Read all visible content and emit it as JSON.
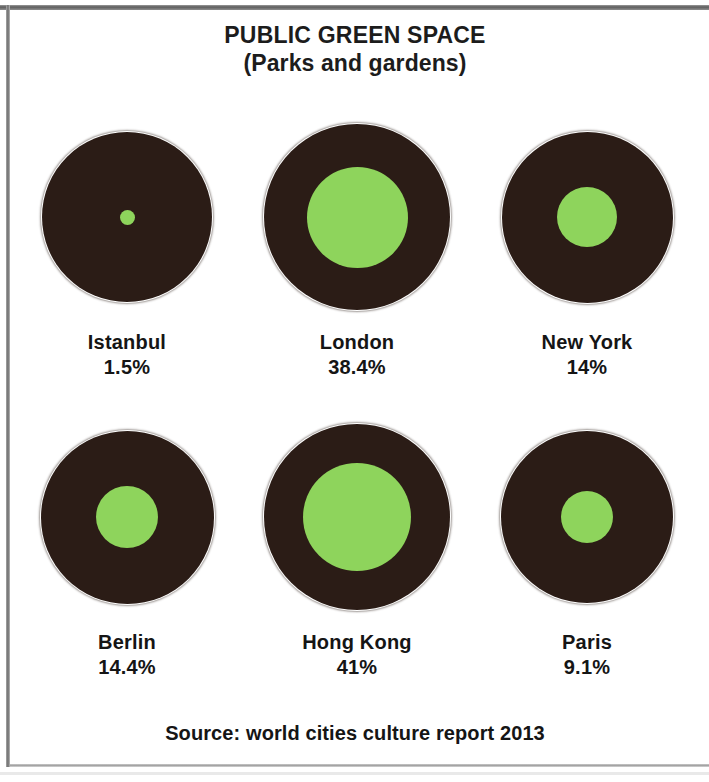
{
  "chart_data": {
    "type": "pie",
    "title": "PUBLIC GREEN SPACE",
    "subtitle": "(Parks and gardens)",
    "xlabel": "",
    "ylabel": "",
    "unit": "%",
    "note": "Each dark disc represents the whole city area; the green disc is the share of public green space (parks and gardens). Green disc area is proportional to the percentage.",
    "source": "Source: world cities culture report 2013",
    "colors": {
      "green": "#8ED45C",
      "dark": "#2B1C16",
      "text": "#151515",
      "background": "#FFFFFF"
    },
    "legend": {
      "position": "none",
      "entries": []
    },
    "grid": false,
    "categories": [
      "Istanbul",
      "London",
      "New York",
      "Berlin",
      "Hong Kong",
      "Paris"
    ],
    "values": [
      1.5,
      38.4,
      14,
      14.4,
      41,
      9.1
    ],
    "cities": [
      {
        "name": "Istanbul",
        "value_label": "1.5%",
        "value": 1.5,
        "outer_diameter_px": 170,
        "inner_diameter_px": 15
      },
      {
        "name": "London",
        "value_label": "38.4%",
        "value": 38.4,
        "outer_diameter_px": 186,
        "inner_diameter_px": 101
      },
      {
        "name": "New York",
        "value_label": "14%",
        "value": 14,
        "outer_diameter_px": 171,
        "inner_diameter_px": 60
      },
      {
        "name": "Berlin",
        "value_label": "14.4%",
        "value": 14.4,
        "outer_diameter_px": 173,
        "inner_diameter_px": 62
      },
      {
        "name": "Hong Kong",
        "value_label": "41%",
        "value": 41,
        "outer_diameter_px": 186,
        "inner_diameter_px": 108
      },
      {
        "name": "Paris",
        "value_label": "9.1%",
        "value": 9.1,
        "outer_diameter_px": 172,
        "inner_diameter_px": 52
      }
    ]
  },
  "layout": {
    "rows": [
      [
        0,
        1,
        2
      ],
      [
        3,
        4,
        5
      ]
    ]
  }
}
